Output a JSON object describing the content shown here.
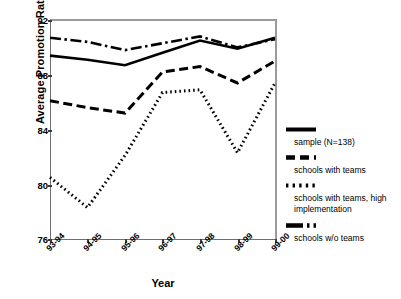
{
  "chart_data": {
    "type": "line",
    "title": "",
    "xlabel": "Year",
    "ylabel": "Average Promotion Rate",
    "categories": [
      "93-94",
      "94-95",
      "95-96",
      "96-97",
      "97-98",
      "98-99",
      "99-00"
    ],
    "ylim": [
      76,
      92
    ],
    "yticks": [
      76,
      80,
      84,
      88,
      92
    ],
    "grid": false,
    "legend_position": "right",
    "series": [
      {
        "name": "sample (N=138)",
        "style": "solid",
        "values": [
          89.4,
          89.1,
          88.7,
          89.6,
          90.5,
          89.9,
          90.7
        ]
      },
      {
        "name": "schools with teams",
        "style": "dashed",
        "values": [
          86.1,
          85.6,
          85.2,
          88.2,
          88.6,
          87.4,
          89.0
        ]
      },
      {
        "name": "schools with teams, high implementation",
        "style": "dotted",
        "values": [
          80.5,
          78.3,
          82.1,
          86.7,
          86.9,
          82.3,
          87.4
        ]
      },
      {
        "name": "schools w/o teams",
        "style": "dash-dot",
        "values": [
          90.7,
          90.4,
          89.8,
          90.3,
          90.8,
          90.0,
          90.6
        ]
      }
    ]
  },
  "axes": {
    "y_title": "Average Promotion Rate",
    "x_title": "Year",
    "y_ticks": [
      "92",
      "88",
      "84",
      "80",
      "76"
    ],
    "x_ticks": [
      "93-94",
      "94-95",
      "95-96",
      "96-97",
      "97-98",
      "98-99",
      "99-00"
    ]
  },
  "legend": {
    "items": [
      {
        "label": "sample (N=138)",
        "style": "solid"
      },
      {
        "label": "schools with teams",
        "style": "dashed"
      },
      {
        "label": "schools with teams, high implementation",
        "style": "dotted"
      },
      {
        "label": "schools w/o teams",
        "style": "dash-dot"
      }
    ]
  },
  "colors": {
    "line": "#000000",
    "axis": "#6f6f6f",
    "background": "#ffffff"
  }
}
